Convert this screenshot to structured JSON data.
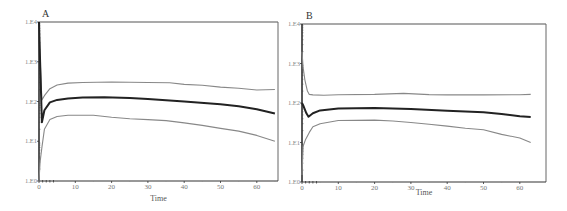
{
  "chart_data": [
    {
      "type": "line",
      "title": "A",
      "xlabel": "Time",
      "ylabel": "",
      "yscale": "log",
      "xlim": [
        0,
        65
      ],
      "ylim": [
        1,
        10000
      ],
      "xticks": [
        0,
        10,
        20,
        30,
        40,
        50,
        60
      ],
      "yticks": [
        "1.E0",
        "1.E1",
        "1.E2",
        "1.E3",
        "1.E4"
      ],
      "grid": false,
      "series": [
        {
          "name": "upper",
          "color": "#888888",
          "x": [
            0,
            0.3,
            0.8,
            1.5,
            3,
            5,
            8,
            12,
            20,
            30,
            36,
            40,
            45,
            50,
            55,
            60,
            65
          ],
          "y": [
            10000,
            1200,
            110,
            140,
            210,
            260,
            290,
            300,
            310,
            300,
            295,
            270,
            255,
            230,
            215,
            195,
            200
          ]
        },
        {
          "name": "median",
          "color": "#222222",
          "x": [
            0,
            0.3,
            0.8,
            1.5,
            3,
            5,
            8,
            12,
            18,
            25,
            30,
            40,
            50,
            55,
            60,
            65
          ],
          "y": [
            10000,
            1000,
            30,
            60,
            95,
            110,
            120,
            125,
            128,
            122,
            115,
            100,
            85,
            76,
            64,
            50
          ]
        },
        {
          "name": "lower",
          "color": "#888888",
          "x": [
            0,
            0.3,
            0.8,
            1.5,
            3,
            5,
            8,
            15,
            20,
            25,
            30,
            35,
            40,
            45,
            50,
            55,
            60,
            65
          ],
          "y": [
            1,
            3,
            7,
            20,
            35,
            42,
            45,
            45,
            40,
            37,
            35,
            33,
            29,
            25,
            21,
            18,
            14,
            10
          ]
        }
      ]
    },
    {
      "type": "line",
      "title": "B",
      "xlabel": "Time",
      "ylabel": "",
      "yscale": "log",
      "xlim": [
        0,
        63
      ],
      "ylim": [
        1,
        10000
      ],
      "xticks": [
        0,
        10,
        20,
        30,
        40,
        50,
        60
      ],
      "yticks": [
        "1.E0",
        "1.E1",
        "1.E2",
        "1.E3",
        "1.E4"
      ],
      "grid": false,
      "series": [
        {
          "name": "upper",
          "color": "#888888",
          "x": [
            0,
            0.3,
            0.8,
            1.5,
            2,
            3,
            6,
            10,
            20,
            28,
            35,
            40,
            50,
            60,
            63
          ],
          "y": [
            2000,
            800,
            380,
            200,
            165,
            160,
            158,
            162,
            165,
            175,
            163,
            160,
            160,
            162,
            165
          ]
        },
        {
          "name": "median",
          "color": "#222222",
          "x": [
            0,
            0.5,
            1.2,
            1.8,
            3,
            5,
            10,
            20,
            30,
            40,
            50,
            55,
            60,
            63
          ],
          "y": [
            100,
            80,
            55,
            45,
            55,
            65,
            72,
            75,
            70,
            64,
            58,
            53,
            46,
            44
          ]
        },
        {
          "name": "lower",
          "color": "#888888",
          "x": [
            0,
            0.3,
            1,
            2,
            3,
            5,
            10,
            20,
            25,
            30,
            35,
            40,
            45,
            50,
            55,
            60,
            63
          ],
          "y": [
            1.5,
            8,
            12,
            18,
            25,
            30,
            36,
            37,
            35,
            32,
            29,
            26,
            23,
            21,
            16,
            13,
            10
          ]
        }
      ]
    }
  ]
}
